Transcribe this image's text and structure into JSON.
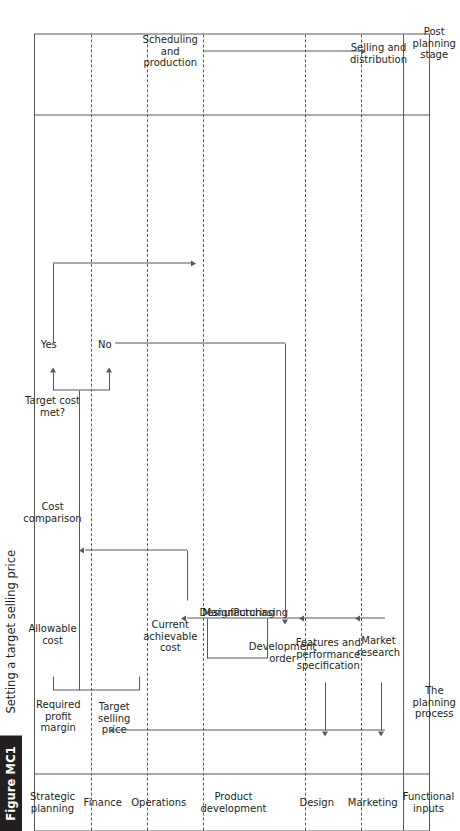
{
  "figure": {
    "tag": "Figure MC1",
    "title": "Setting a target selling price"
  },
  "lanes": [
    {
      "id": "strategic-planning",
      "label": "Strategic\nplanning"
    },
    {
      "id": "finance",
      "label": "Finance"
    },
    {
      "id": "operations",
      "label": "Operations"
    },
    {
      "id": "product-development",
      "label": "Product development"
    },
    {
      "id": "design",
      "label": "Design"
    },
    {
      "id": "marketing",
      "label": "Marketing"
    },
    {
      "id": "functional-inputs",
      "label": "Functional\ninputs"
    }
  ],
  "stages": {
    "planning_process": "The\nplanning\nprocess",
    "post_planning_stage": "Post\nplanning\nstage"
  },
  "nodes": {
    "required_profit_margin": "Required\nprofit\nmargin",
    "allowable_cost": "Allowable\ncost",
    "cost_comparison": "Cost\ncomparison",
    "target_cost_met": "Target cost\nmet?",
    "yes": "Yes",
    "no": "No",
    "target_selling_price": "Target\nselling\nprice",
    "current_achievable_cost": "Current\nachievable\ncost",
    "design": "Design",
    "manufacturing": "Manufacturing",
    "purchasing": "Purchasing",
    "development_order": "Development\norder",
    "features_and_performance_specification": "Features and\nperformance\nspecification",
    "market_research": "Market\nresearch",
    "scheduling_and_production": "Scheduling\nand\nproduction",
    "selling_and_distribution": "Selling and\ndistribution"
  },
  "colors": {
    "ink": "#231f20",
    "rule": "#58595b",
    "tag_background": "#231f20",
    "tag_text": "#ffffff",
    "page_background": "#ffffff"
  }
}
